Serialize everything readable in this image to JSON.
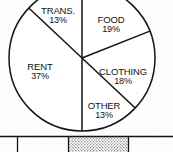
{
  "figure": {
    "kind": "scanned-pie-chart",
    "ink_color": "#141414",
    "paper_color": "#fdfdfc"
  },
  "chart_data": {
    "type": "pie",
    "title": "",
    "subtitle": "",
    "xlabel": "",
    "ylabel": "",
    "legend_position": "none",
    "grid": false,
    "labels_inside_slices": true,
    "unit": "%",
    "total": 100,
    "categories": [
      "FOOD",
      "CLOTHING",
      "OTHER",
      "RENT",
      "TRANS."
    ],
    "values": [
      19,
      18,
      13,
      37,
      13
    ],
    "slices": [
      {
        "label": "FOOD",
        "value": 19,
        "value_text": "19%",
        "start_angle_deg": 0,
        "end_angle_deg": 68.4,
        "label_x": 111,
        "label_y": 20
      },
      {
        "label": "CLOTHING",
        "value": 18,
        "value_text": "18%",
        "start_angle_deg": 68.4,
        "end_angle_deg": 133.2,
        "label_x": 123,
        "label_y": 72
      },
      {
        "label": "OTHER",
        "value": 13,
        "value_text": "13%",
        "start_angle_deg": 133.2,
        "end_angle_deg": 180,
        "label_x": 104,
        "label_y": 106
      },
      {
        "label": "RENT",
        "value": 37,
        "value_text": "37%",
        "start_angle_deg": 180,
        "end_angle_deg": 313.2,
        "label_x": 40,
        "label_y": 67
      },
      {
        "label": "TRANS.",
        "value": 13,
        "value_text": "13%",
        "start_angle_deg": 313.2,
        "end_angle_deg": 360,
        "label_x": 58,
        "label_y": 11
      }
    ],
    "geometry": {
      "center_x": 82,
      "center_y": 58,
      "radius": 73,
      "top_cropped": true
    }
  },
  "bottom_strip": {
    "rule_y": 136,
    "cells": [
      {
        "name": "cell-1",
        "x": 0,
        "width": 17,
        "shaded": false,
        "text": ""
      },
      {
        "name": "cell-2",
        "x": 17,
        "width": 51,
        "shaded": false,
        "text": ""
      },
      {
        "name": "cell-3",
        "x": 68,
        "width": 60,
        "shaded": true,
        "text": ""
      },
      {
        "name": "cell-4",
        "x": 128,
        "width": 45,
        "shaded": false,
        "text": ""
      }
    ]
  }
}
